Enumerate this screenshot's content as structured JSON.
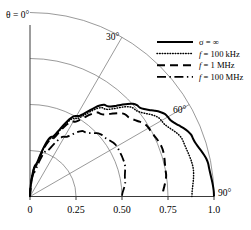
{
  "figure": {
    "name": "polar-radiation-pattern",
    "background_color": "#ffffff",
    "axis_color": "#3a3a3a",
    "grid_color": "#6e6e6e",
    "curve_color": "#000000"
  },
  "labels": {
    "theta_origin": "θ = 0°",
    "angle_30": "30°",
    "angle_60": "60°",
    "angle_90": "90°"
  },
  "legend": {
    "position": "top-right",
    "entries": [
      {
        "label": "σ = ∞",
        "symbol": "σ",
        "equals": "=",
        "value": "∞",
        "style": "solid",
        "italic_symbol": false
      },
      {
        "label": "f = 100 kHz",
        "symbol": "f",
        "equals": "=",
        "value": "100 kHz",
        "style": "dotted",
        "italic_symbol": true
      },
      {
        "label": "f = 1 MHz",
        "symbol": "f",
        "equals": "=",
        "value": "1 MHz",
        "style": "dashed",
        "italic_symbol": true
      },
      {
        "label": "f = 100 MHz",
        "symbol": "f",
        "equals": "=",
        "value": "100 MHz",
        "style": "dashdot",
        "italic_symbol": true
      }
    ]
  },
  "chart_data": {
    "type": "line",
    "coordinate_system": "quarter-polar",
    "title": "",
    "xlabel": "",
    "ylabel": "",
    "xlim": [
      0,
      1.0
    ],
    "ylim": [
      0,
      1.0
    ],
    "grid": true,
    "xticks": [
      "0",
      "0.25",
      "0.50",
      "0.75",
      "1.0"
    ],
    "xtick_values": [
      0,
      0.25,
      0.5,
      0.75,
      1.0
    ],
    "polar_radial_gridlines_deg": [
      30,
      60
    ],
    "polar_arc_radii": [
      0.25,
      0.5,
      0.75,
      1.0
    ],
    "angle_labels_deg": [
      0,
      30,
      60,
      90
    ],
    "series": [
      {
        "name": "σ = ∞",
        "style": "solid",
        "r_theta": [
          {
            "theta_deg": 0,
            "r": 0.0
          },
          {
            "theta_deg": 10,
            "r": 0.175
          },
          {
            "theta_deg": 20,
            "r": 0.345
          },
          {
            "theta_deg": 30,
            "r": 0.505
          },
          {
            "theta_deg": 40,
            "r": 0.645
          },
          {
            "theta_deg": 50,
            "r": 0.765
          },
          {
            "theta_deg": 60,
            "r": 0.865
          },
          {
            "theta_deg": 70,
            "r": 0.94
          },
          {
            "theta_deg": 80,
            "r": 0.985
          },
          {
            "theta_deg": 90,
            "r": 1.0
          }
        ]
      },
      {
        "name": "f = 100 kHz",
        "style": "dotted",
        "r_theta": [
          {
            "theta_deg": 0,
            "r": 0.0
          },
          {
            "theta_deg": 10,
            "r": 0.17
          },
          {
            "theta_deg": 20,
            "r": 0.335
          },
          {
            "theta_deg": 30,
            "r": 0.49
          },
          {
            "theta_deg": 40,
            "r": 0.625
          },
          {
            "theta_deg": 50,
            "r": 0.74
          },
          {
            "theta_deg": 60,
            "r": 0.825
          },
          {
            "theta_deg": 70,
            "r": 0.885
          },
          {
            "theta_deg": 80,
            "r": 0.9
          },
          {
            "theta_deg": 90,
            "r": 0.88
          }
        ]
      },
      {
        "name": "f = 1 MHz",
        "style": "dashed",
        "r_theta": [
          {
            "theta_deg": 0,
            "r": 0.0
          },
          {
            "theta_deg": 10,
            "r": 0.165
          },
          {
            "theta_deg": 20,
            "r": 0.325
          },
          {
            "theta_deg": 30,
            "r": 0.47
          },
          {
            "theta_deg": 40,
            "r": 0.59
          },
          {
            "theta_deg": 50,
            "r": 0.685
          },
          {
            "theta_deg": 60,
            "r": 0.745
          },
          {
            "theta_deg": 70,
            "r": 0.765
          },
          {
            "theta_deg": 80,
            "r": 0.75
          },
          {
            "theta_deg": 90,
            "r": 0.72
          }
        ]
      },
      {
        "name": "f = 100 MHz",
        "style": "dashdot",
        "r_theta": [
          {
            "theta_deg": 0,
            "r": 0.0
          },
          {
            "theta_deg": 10,
            "r": 0.135
          },
          {
            "theta_deg": 20,
            "r": 0.265
          },
          {
            "theta_deg": 30,
            "r": 0.375
          },
          {
            "theta_deg": 40,
            "r": 0.46
          },
          {
            "theta_deg": 50,
            "r": 0.515
          },
          {
            "theta_deg": 60,
            "r": 0.545
          },
          {
            "theta_deg": 70,
            "r": 0.545
          },
          {
            "theta_deg": 80,
            "r": 0.525
          },
          {
            "theta_deg": 90,
            "r": 0.5
          }
        ]
      }
    ]
  }
}
